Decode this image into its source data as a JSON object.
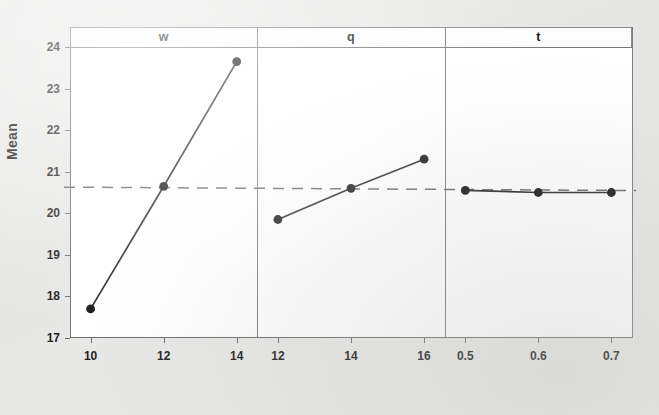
{
  "chart_data": {
    "type": "line",
    "title": "",
    "subtitle": "",
    "xlabel": "",
    "ylabel": "Mean",
    "ylim": [
      17,
      24
    ],
    "yticks": [
      17,
      18,
      19,
      20,
      21,
      22,
      23,
      24
    ],
    "grid": false,
    "legend": null,
    "reference_line": {
      "type": "horizontal-dashed",
      "value": 20.6,
      "label": "overall mean"
    },
    "panels": [
      {
        "name": "w",
        "categories": [
          "10",
          "12",
          "14"
        ],
        "values": [
          17.7,
          20.65,
          23.65
        ]
      },
      {
        "name": "q",
        "categories": [
          "12",
          "14",
          "16"
        ],
        "values": [
          19.85,
          20.6,
          21.3
        ]
      },
      {
        "name": "t",
        "categories": [
          "0.5",
          "0.6",
          "0.7"
        ],
        "values": [
          20.55,
          20.5,
          20.5
        ]
      }
    ],
    "colors": {
      "line": "#2b2b2b",
      "marker": "#1a1a1a",
      "reference": "#6b6b6b",
      "axis": "#6f6f6f",
      "panel_background": "#ffffff",
      "page_background": "#e8e8e6"
    }
  },
  "axis": {
    "y_label": "Mean",
    "y_ticks": [
      "24",
      "23",
      "22",
      "21",
      "20",
      "19",
      "18",
      "17"
    ]
  },
  "panel_labels": [
    "w",
    "q",
    "t"
  ],
  "x_tick_labels": {
    "w": [
      "10",
      "12",
      "14"
    ],
    "q": [
      "12",
      "14",
      "16"
    ],
    "t": [
      "0.5",
      "0.6",
      "0.7"
    ]
  }
}
